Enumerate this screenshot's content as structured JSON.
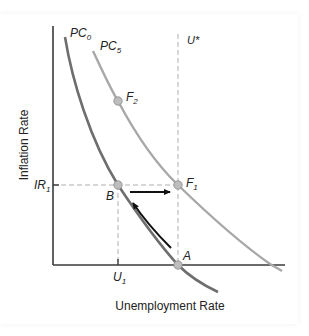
{
  "figure": {
    "y_axis_label": "Inflation Rate",
    "x_axis_label": "Unemployment Rate",
    "curves": [
      {
        "name": "PC",
        "sub": "0",
        "color": "#6e6e6e"
      },
      {
        "name": "PC",
        "sub": "5",
        "color": "#a8a8a8"
      }
    ],
    "reference_lines": {
      "natural_rate": {
        "label": "U*"
      },
      "inflation_level": {
        "name": "IR",
        "sub": "1"
      },
      "unemployment_level": {
        "name": "U",
        "sub": "1"
      }
    },
    "points": [
      {
        "id": "A",
        "label": "A",
        "sub": ""
      },
      {
        "id": "B",
        "label": "B",
        "sub": ""
      },
      {
        "id": "F1",
        "label": "F",
        "sub": "1"
      },
      {
        "id": "F2",
        "label": "F",
        "sub": "2"
      }
    ],
    "colors": {
      "axis": "#3a3a3a",
      "pc0": "#6e6e6e",
      "pc5": "#a8a8a8",
      "dashed": "#b0b0b0",
      "point_fill": "#bdbdbd",
      "arrow": "#111111"
    }
  }
}
